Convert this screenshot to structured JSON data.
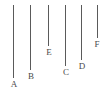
{
  "figure": {
    "background_color": "#ffffff",
    "line_color": "#5a5a5a",
    "label_color": "#4a4a4a",
    "line_width_px": 1,
    "canvas": {
      "width": 107,
      "height": 96
    }
  },
  "chart_data": {
    "type": "bar",
    "title": "",
    "xlabel": "",
    "ylabel": "",
    "orientation": "vertical-lines-hanging-from-common-top",
    "grid": false,
    "legend": null,
    "categories": [
      "A",
      "B",
      "C",
      "D",
      "E",
      "F"
    ],
    "values": [
      73,
      65,
      61,
      55,
      41,
      33
    ],
    "value_units": "pixels (line length)",
    "common_top_y": 5,
    "bottom_y": [
      78,
      70,
      66,
      60,
      46,
      38
    ],
    "x_positions": [
      13,
      30,
      65,
      81,
      48,
      97
    ],
    "draw_order_left_to_right": [
      "A",
      "B",
      "E",
      "C",
      "D",
      "F"
    ]
  },
  "lines": [
    {
      "label": "A",
      "x": 13,
      "top": 5,
      "bottom": 78,
      "length": 73,
      "label_x": 9,
      "label_y": 80
    },
    {
      "label": "B",
      "x": 30,
      "top": 5,
      "bottom": 70,
      "length": 65,
      "label_x": 26,
      "label_y": 72
    },
    {
      "label": "E",
      "x": 48,
      "top": 5,
      "bottom": 46,
      "length": 41,
      "label_x": 44,
      "label_y": 48
    },
    {
      "label": "C",
      "x": 65,
      "top": 5,
      "bottom": 66,
      "length": 61,
      "label_x": 61,
      "label_y": 68
    },
    {
      "label": "D",
      "x": 81,
      "top": 5,
      "bottom": 60,
      "length": 55,
      "label_x": 77,
      "label_y": 62
    },
    {
      "label": "F",
      "x": 97,
      "top": 5,
      "bottom": 38,
      "length": 33,
      "label_x": 92,
      "label_y": 40
    }
  ]
}
